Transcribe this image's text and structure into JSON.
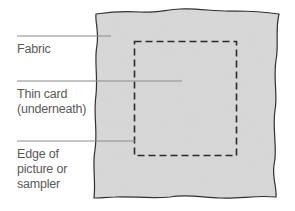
{
  "diagram": {
    "colors": {
      "fabric_fill": "#d9d9d9",
      "outline": "#2b2b2b",
      "leader_line": "#8a8a8a",
      "label_text": "#5a5a5a",
      "background": "#ffffff"
    },
    "labels": [
      {
        "id": "fabric",
        "text": "Fabric"
      },
      {
        "id": "thin-card",
        "text": "Thin card\n(underneath)"
      },
      {
        "id": "edge",
        "text": "Edge of\npicture or\nsampler"
      }
    ]
  }
}
